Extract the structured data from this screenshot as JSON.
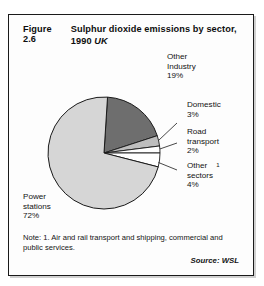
{
  "figure": {
    "number": "Figure 2.6",
    "title": "Sulphur dioxide emissions by sector, 1990",
    "region": "UK"
  },
  "note": {
    "text": "Note: 1. Air and rail transport and shipping, commercial and public services.",
    "source": "Source: WSL"
  },
  "labels": {
    "other_industry": {
      "name": "Other",
      "name2": "Industry",
      "value": "19%"
    },
    "domestic": {
      "name": "Domestic",
      "value": "3%"
    },
    "road_transport": {
      "name": "Road",
      "name2": "transport",
      "value": "2%"
    },
    "other_sectors": {
      "name": "Other",
      "footnote": "1",
      "name2": "sectors",
      "value": "4%"
    },
    "power_stations": {
      "name": "Power",
      "name2": "stations",
      "value": "72%"
    }
  },
  "colors": {
    "power_stations": "#d6d6d6",
    "other_industry": "#6e6e6e",
    "domestic": "#bdbdbd",
    "road_transport": "#ffffff",
    "other_sectors": "#ffffff",
    "outline": "#1a1a1a",
    "frame": "#1a1a1a"
  },
  "chart_data": {
    "type": "pie",
    "subtitle": "",
    "xlabel": "",
    "ylabel": "",
    "unit": "percent",
    "legend_position": "none",
    "labels_position": "outside-with-leader-lines",
    "start_angle_deg": 0,
    "direction": "clockwise",
    "categories": [
      "Other Industry",
      "Domestic",
      "Road transport",
      "Other sectors",
      "Power stations"
    ],
    "values": [
      19,
      3,
      2,
      4,
      72
    ],
    "slice_colors": [
      "#6e6e6e",
      "#bdbdbd",
      "#ffffff",
      "#ffffff",
      "#d6d6d6"
    ],
    "data_labels": [
      "19%",
      "3%",
      "2%",
      "4%",
      "72%"
    ],
    "footnotes": {
      "Other sectors": "1. Air and rail transport and shipping, commercial and public services."
    },
    "total": 100,
    "source": "WSL"
  }
}
